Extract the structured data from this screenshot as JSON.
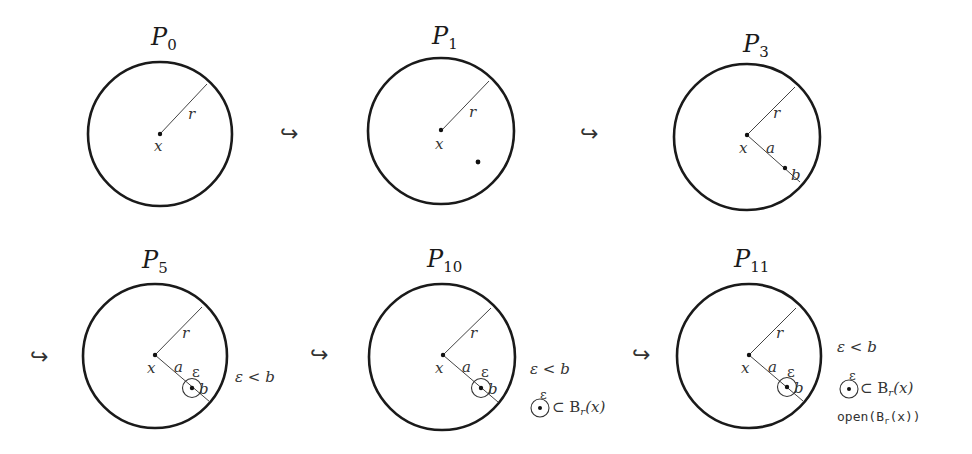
{
  "diagram": {
    "colors": {
      "stroke": "#1a1a1a",
      "text": "#333333",
      "background": "#ffffff"
    },
    "arrow_glyph": "↪",
    "panels": [
      {
        "id": "P0",
        "title": "P",
        "subscript": "0",
        "labels": {
          "center": "x",
          "radius": "r"
        },
        "notes": []
      },
      {
        "id": "P1",
        "title": "P",
        "subscript": "1",
        "labels": {
          "center": "x",
          "radius": "r"
        },
        "notes": []
      },
      {
        "id": "P3",
        "title": "P",
        "subscript": "3",
        "labels": {
          "center": "x",
          "radius": "r",
          "a": "a",
          "b": "b"
        },
        "notes": []
      },
      {
        "id": "P5",
        "title": "P",
        "subscript": "5",
        "labels": {
          "center": "x",
          "radius": "r",
          "a": "a",
          "b": "b",
          "eps": "ε"
        },
        "notes": [
          "ε < b"
        ]
      },
      {
        "id": "P10",
        "title": "P",
        "subscript": "10",
        "labels": {
          "center": "x",
          "radius": "r",
          "a": "a",
          "b": "b",
          "eps": "ε"
        },
        "notes": [
          "ε < b",
          "⊂ B",
          "r",
          "(x)"
        ]
      },
      {
        "id": "P11",
        "title": "P",
        "subscript": "11",
        "labels": {
          "center": "x",
          "radius": "r",
          "a": "a",
          "b": "b",
          "eps": "ε"
        },
        "notes": [
          "ε < b",
          "⊂ B",
          "r",
          "(x)",
          "open(B",
          "r",
          "(x))"
        ]
      }
    ]
  }
}
